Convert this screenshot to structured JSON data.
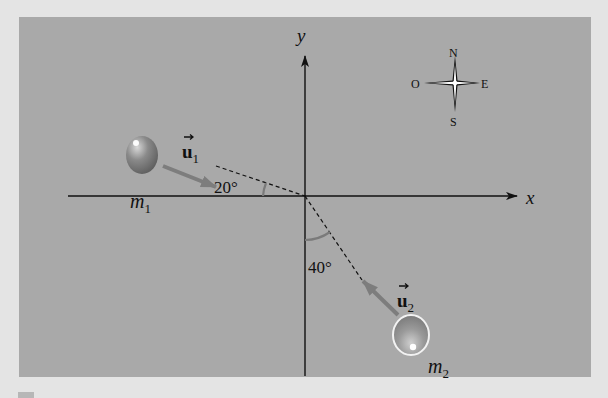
{
  "figure": {
    "type": "physics-collision-diagram",
    "background_color": "#e4e4e4",
    "panel_color": "#a9a9a9",
    "axes": {
      "x_label": "x",
      "y_label": "y"
    },
    "compass": {
      "north": "N",
      "south": "S",
      "east": "E",
      "west": "O"
    },
    "mass_1": {
      "label": "m",
      "subscript": "1",
      "velocity_label": "u",
      "velocity_subscript": "1",
      "angle": "20°",
      "angle_reference": "x-axis (below, from left)"
    },
    "mass_2": {
      "label": "m",
      "subscript": "2",
      "velocity_label": "u",
      "velocity_subscript": "2",
      "angle": "40°",
      "angle_reference": "negative y-axis"
    },
    "arrow_color": "#7d7d7d",
    "axis_color": "#111111"
  }
}
